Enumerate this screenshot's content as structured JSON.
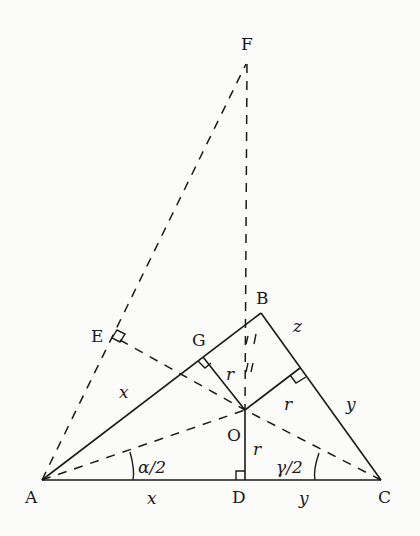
{
  "diagram": {
    "title": "",
    "points": {
      "A": {
        "label": "A",
        "x": 42,
        "y": 480
      },
      "B": {
        "label": "B",
        "x": 261,
        "y": 313
      },
      "C": {
        "label": "C",
        "x": 381,
        "y": 480
      },
      "D": {
        "label": "D",
        "x": 245,
        "y": 480
      },
      "O": {
        "label": "O",
        "x": 245,
        "y": 410
      },
      "F": {
        "label": "F",
        "x": 248,
        "y": 62
      },
      "G": {
        "label": "G",
        "x": 203,
        "y": 357
      },
      "E": {
        "label": "E",
        "x": 118,
        "y": 335
      },
      "H": {
        "label": "",
        "x": 300,
        "y": 368
      }
    },
    "segment_labels": {
      "AG": "x",
      "AD": "x",
      "BH": "z",
      "HC": "y",
      "DC": "y",
      "OG": "r",
      "OH": "r",
      "OD": "r"
    },
    "angle_labels": {
      "A": "α/2",
      "C": "γ/2"
    },
    "solid_lines": [
      "AB",
      "BC",
      "CA",
      "OG",
      "OH",
      "OD"
    ],
    "dashed_lines": [
      "AF",
      "FB",
      "BO",
      "AO",
      "CO",
      "OE"
    ],
    "right_angles": [
      "E",
      "G",
      "H",
      "D"
    ],
    "colors": {
      "ink": "#1a1a1a",
      "background": "#fbfbf9"
    }
  }
}
